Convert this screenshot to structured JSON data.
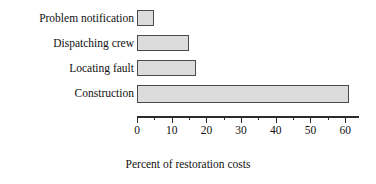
{
  "chart_data": {
    "type": "bar",
    "orientation": "horizontal",
    "title": "",
    "xlabel": "Percent of restoration costs",
    "ylabel": "",
    "categories": [
      "Problem notification",
      "Dispatching crew",
      "Locating fault",
      "Construction"
    ],
    "values": [
      5,
      15,
      17,
      61
    ],
    "xlim": [
      0,
      64
    ],
    "xticks": [
      0,
      10,
      20,
      30,
      40,
      50,
      60
    ],
    "xtick_labels": [
      "0",
      "10",
      "20",
      "30",
      "40",
      "50",
      "60"
    ],
    "minor_xticks": [
      5,
      15,
      25,
      35,
      45,
      55
    ],
    "grid": false,
    "legend": false,
    "bar_fill_color": "#dcdcdc",
    "bar_border_color": "#4a4a4a",
    "axis_color": "#2b2b2b"
  }
}
